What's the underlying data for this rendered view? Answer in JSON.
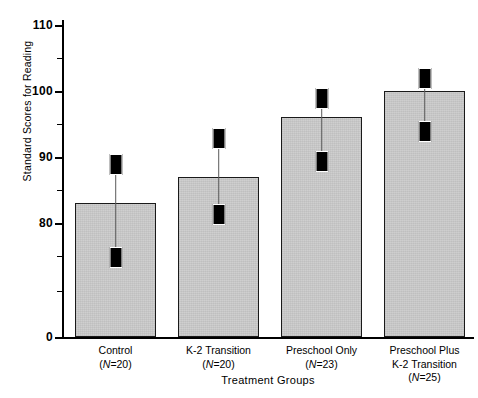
{
  "chart_data": {
    "type": "bar",
    "title": "",
    "xlabel": "Treatment Groups",
    "ylabel": "Standard Scores for Reading",
    "categories": [
      "Control",
      "K-2 Transition",
      "Preschool Only",
      "Preschool Plus K-2 Transition"
    ],
    "category_lines": [
      [
        "Control",
        "(N=20)"
      ],
      [
        "K-2 Transition",
        "(N=20)"
      ],
      [
        "Preschool Only",
        "(N=23)"
      ],
      [
        "Preschool Plus",
        "K-2 Transition",
        "(N=25)"
      ]
    ],
    "n_values": [
      20,
      20,
      23,
      25
    ],
    "values": [
      83.0,
      87.0,
      96.0,
      100.0
    ],
    "error_low": [
      75.0,
      81.5,
      89.5,
      94.0
    ],
    "error_high": [
      89.0,
      93.0,
      99.0,
      102.0
    ],
    "ylim": [
      0,
      110
    ],
    "y_axis_break": true,
    "y_break_note": "axis jumps from 0 to 80 region; ticks shown at 80, 90, 100, 110 with minor ticks between",
    "yticks_major": [
      0,
      80,
      90,
      100,
      110
    ],
    "yticks_major_labels": [
      "0",
      "80",
      "90",
      "100",
      "110"
    ],
    "yticks_minor": [
      75,
      85,
      95,
      105
    ],
    "grid": false,
    "legend": null,
    "bar_color": "#cccccc",
    "bar_edge_color": "#1a1a1a",
    "error_color": "#000000"
  },
  "axis": {
    "y_title": "Standard Scores for Reading",
    "x_title": "Treatment Groups",
    "tick_labels": [
      "110",
      "100",
      "90",
      "80",
      "0"
    ]
  },
  "bars": [
    {
      "label": "Control",
      "n_label": "(N=20)",
      "value": 83.0,
      "err_low": 75.0,
      "err_high": 89.0
    },
    {
      "label": "K-2 Transition",
      "n_label": "(N=20)",
      "value": 87.0,
      "err_low": 81.5,
      "err_high": 93.0
    },
    {
      "label": "Preschool Only",
      "n_label": "(N=23)",
      "value": 96.0,
      "err_low": 89.5,
      "err_high": 99.0
    },
    {
      "label": "Preschool Plus",
      "label2": "K-2 Transition",
      "n_label": "(N=25)",
      "value": 100.0,
      "err_low": 94.0,
      "err_high": 102.0
    }
  ]
}
